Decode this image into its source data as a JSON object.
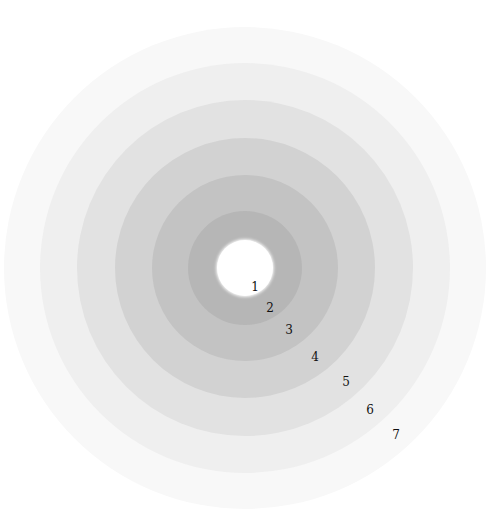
{
  "diagram": {
    "type": "concentric-circles",
    "center": {
      "x": 245,
      "y": 268
    },
    "rings": [
      {
        "level": "7",
        "radius": 241,
        "color": "#f8f8f8",
        "label_x": 396,
        "label_y": 435
      },
      {
        "level": "6",
        "radius": 205,
        "color": "#efefef",
        "label_x": 370,
        "label_y": 410
      },
      {
        "level": "5",
        "radius": 168,
        "color": "#e2e2e2",
        "label_x": 346,
        "label_y": 382
      },
      {
        "level": "4",
        "radius": 130,
        "color": "#d2d2d2",
        "label_x": 315,
        "label_y": 357
      },
      {
        "level": "3",
        "radius": 93,
        "color": "#c3c3c3",
        "label_x": 289,
        "label_y": 330
      },
      {
        "level": "2",
        "radius": 57,
        "color": "#b6b6b6",
        "label_x": 270,
        "label_y": 308
      },
      {
        "level": "1",
        "radius": 28,
        "color": "#ffffff",
        "label_x": 255,
        "label_y": 287
      }
    ]
  }
}
